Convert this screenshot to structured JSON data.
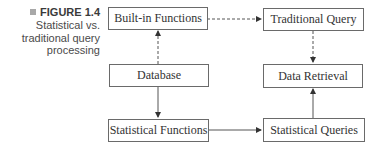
{
  "caption": {
    "label": "FIGURE 1.4",
    "lines": [
      "Statistical vs.",
      "traditional query",
      "processing"
    ]
  },
  "nodes": {
    "builtin": "Built-in Functions",
    "traditional": "Traditional Query",
    "database": "Database",
    "retrieval": "Data Retrieval",
    "statfunc": "Statistical Functions",
    "statqueries": "Statistical Queries"
  },
  "edges": [
    {
      "from": "database",
      "to": "builtin",
      "style": "dashed"
    },
    {
      "from": "builtin",
      "to": "traditional",
      "style": "dashed"
    },
    {
      "from": "traditional",
      "to": "retrieval",
      "style": "dashed"
    },
    {
      "from": "database",
      "to": "statfunc",
      "style": "solid"
    },
    {
      "from": "statfunc",
      "to": "statqueries",
      "style": "solid"
    },
    {
      "from": "statqueries",
      "to": "retrieval",
      "style": "solid"
    }
  ]
}
